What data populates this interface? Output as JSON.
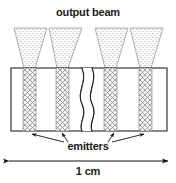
{
  "figure": {
    "type": "technical-schematic",
    "title": "output beam",
    "emitters_label": "emitters",
    "scale_label": "1 cm",
    "colors": {
      "outline": "#222222",
      "hatch": "#808080",
      "beam_fill": "#f2f2f2",
      "beam_outline": "#999999",
      "background": "#ffffff",
      "arrow": "#111111"
    },
    "geometry": {
      "body_rect": {
        "x": 11,
        "y": 68,
        "width": 156,
        "height": 63
      },
      "break_squiggle_x": 88,
      "emitter_stripes": [
        {
          "x": 23,
          "width": 13
        },
        {
          "x": 56,
          "width": 13
        },
        {
          "x": 104,
          "width": 13
        },
        {
          "x": 139,
          "width": 13
        }
      ],
      "beams": [
        {
          "top_x1": 14,
          "top_x2": 47,
          "bottom_x1": 24,
          "bottom_x2": 35,
          "top_y": 28,
          "bottom_y": 68
        },
        {
          "top_x1": 49,
          "top_x2": 82,
          "bottom_x1": 57,
          "bottom_x2": 68,
          "top_y": 28,
          "bottom_y": 68
        },
        {
          "top_x1": 95,
          "top_x2": 128,
          "bottom_x1": 105,
          "bottom_x2": 116,
          "top_y": 28,
          "bottom_y": 68
        },
        {
          "top_x1": 130,
          "top_x2": 163,
          "bottom_x1": 140,
          "bottom_x2": 151,
          "top_y": 28,
          "bottom_y": 68
        }
      ],
      "scale_arrow": {
        "x1": 9,
        "x2": 168,
        "y": 161
      },
      "pointer_arrows": [
        {
          "from_x": 61,
          "from_y": 141,
          "to_x": 30,
          "to_y": 134
        },
        {
          "from_x": 66,
          "from_y": 141,
          "to_x": 61,
          "to_y": 134
        },
        {
          "from_x": 110,
          "from_y": 141,
          "to_x": 115,
          "to_y": 134
        },
        {
          "from_x": 115,
          "from_y": 141,
          "to_x": 146,
          "to_y": 134
        }
      ]
    }
  }
}
